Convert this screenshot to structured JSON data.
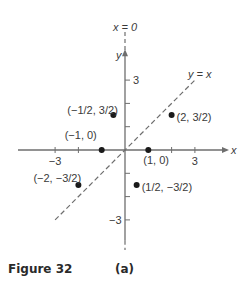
{
  "figure": {
    "caption": "Figure 32",
    "sublabel": "(a)"
  },
  "chart_data": {
    "type": "scatter",
    "title": "",
    "xlabel": "x",
    "ylabel": "y",
    "xlim": [
      -4.5,
      4.5
    ],
    "ylim": [
      -4.5,
      4.5
    ],
    "x_ticks": [
      -3,
      -2,
      -1,
      1,
      2,
      3
    ],
    "y_ticks": [
      -3,
      -2,
      -1,
      1,
      2,
      3
    ],
    "x_tick_labels": {
      "-3": "−3",
      "3": "3"
    },
    "y_tick_labels": {
      "3": "3",
      "-3": "−3"
    },
    "lines": [
      {
        "name": "y = x",
        "label": "y = x",
        "style": "dashed",
        "slope": 1,
        "intercept": 0,
        "x_range": [
          -3,
          3
        ]
      },
      {
        "name": "x = 0",
        "label": "x = 0",
        "style": "dashed",
        "vertical_at": 0
      }
    ],
    "points": [
      {
        "x": -0.5,
        "y": 1.5,
        "label": "(−1/2, 3/2)"
      },
      {
        "x": 2,
        "y": 1.5,
        "label": "(2, 3/2)"
      },
      {
        "x": -1,
        "y": 0,
        "label": "(−1, 0)"
      },
      {
        "x": 1,
        "y": 0,
        "label": "(1, 0)"
      },
      {
        "x": -2,
        "y": -1.5,
        "label": "(−2, −3/2)"
      },
      {
        "x": 0.5,
        "y": -1.5,
        "label": "(1/2, −3/2)"
      }
    ],
    "grid": false,
    "legend": "none"
  }
}
